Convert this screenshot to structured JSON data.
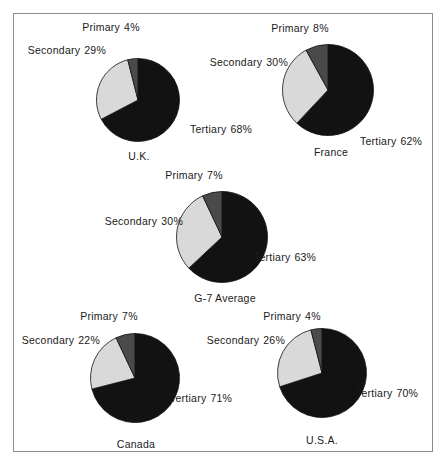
{
  "figure": {
    "background_color": "#ffffff",
    "frame_color": "#8c8c8c",
    "slice_colors": {
      "primary": "#4a4a4a",
      "secondary": "#d9d9d9",
      "tertiary": "#121212"
    },
    "slice_edge_color": "#111111"
  },
  "chart_data": [
    {
      "type": "pie",
      "title": "U.K.",
      "categories": [
        "Primary",
        "Secondary",
        "Tertiary"
      ],
      "values": [
        4,
        29,
        68
      ],
      "labels": [
        "Primary  4%",
        "Secondary  29%",
        "Tertiary  68%"
      ],
      "colors": [
        "#4a4a4a",
        "#d9d9d9",
        "#121212"
      ],
      "unit": "%"
    },
    {
      "type": "pie",
      "title": "France",
      "categories": [
        "Primary",
        "Secondary",
        "Tertiary"
      ],
      "values": [
        8,
        30,
        62
      ],
      "labels": [
        "Primary  8%",
        "Secondary  30%",
        "Tertiary  62%"
      ],
      "colors": [
        "#4a4a4a",
        "#d9d9d9",
        "#121212"
      ],
      "unit": "%"
    },
    {
      "type": "pie",
      "title": "G-7 Average",
      "categories": [
        "Primary",
        "Secondary",
        "Tertiary"
      ],
      "values": [
        7,
        30,
        63
      ],
      "labels": [
        "Primary  7%",
        "Secondary  30%",
        "Tertiary  63%"
      ],
      "colors": [
        "#4a4a4a",
        "#d9d9d9",
        "#121212"
      ],
      "unit": "%"
    },
    {
      "type": "pie",
      "title": "Canada",
      "categories": [
        "Primary",
        "Secondary",
        "Tertiary"
      ],
      "values": [
        7,
        22,
        71
      ],
      "labels": [
        "Primary  7%",
        "Secondary  22%",
        "Tertiary  71%"
      ],
      "colors": [
        "#4a4a4a",
        "#d9d9d9",
        "#121212"
      ],
      "unit": "%"
    },
    {
      "type": "pie",
      "title": "U.S.A.",
      "categories": [
        "Primary",
        "Secondary",
        "Tertiary"
      ],
      "values": [
        4,
        26,
        70
      ],
      "labels": [
        "Primary  4%",
        "Secondary  26%",
        "Tertiary  70%"
      ],
      "colors": [
        "#4a4a4a",
        "#d9d9d9",
        "#121212"
      ],
      "unit": "%"
    }
  ],
  "charts": {
    "uk": {
      "title": "U.K.",
      "primary_label": "Primary",
      "primary_value": "4%",
      "secondary_label": "Secondary",
      "secondary_value": "29%",
      "tertiary_label": "Tertiary",
      "tertiary_value": "68%"
    },
    "france": {
      "title": "France",
      "primary_label": "Primary",
      "primary_value": "8%",
      "secondary_label": "Secondary",
      "secondary_value": "30%",
      "tertiary_label": "Tertiary",
      "tertiary_value": "62%"
    },
    "g7": {
      "title": "G-7 Average",
      "primary_label": "Primary",
      "primary_value": "7%",
      "secondary_label": "Secondary",
      "secondary_value": "30%",
      "tertiary_label": "Tertiary",
      "tertiary_value": "63%"
    },
    "canada": {
      "title": "Canada",
      "primary_label": "Primary",
      "primary_value": "7%",
      "secondary_label": "Secondary",
      "secondary_value": "22%",
      "tertiary_label": "Tertiary",
      "tertiary_value": "71%"
    },
    "usa": {
      "title": "U.S.A.",
      "primary_label": "Primary",
      "primary_value": "4%",
      "secondary_label": "Secondary",
      "secondary_value": "26%",
      "tertiary_label": "Tertiary",
      "tertiary_value": "70%"
    }
  }
}
